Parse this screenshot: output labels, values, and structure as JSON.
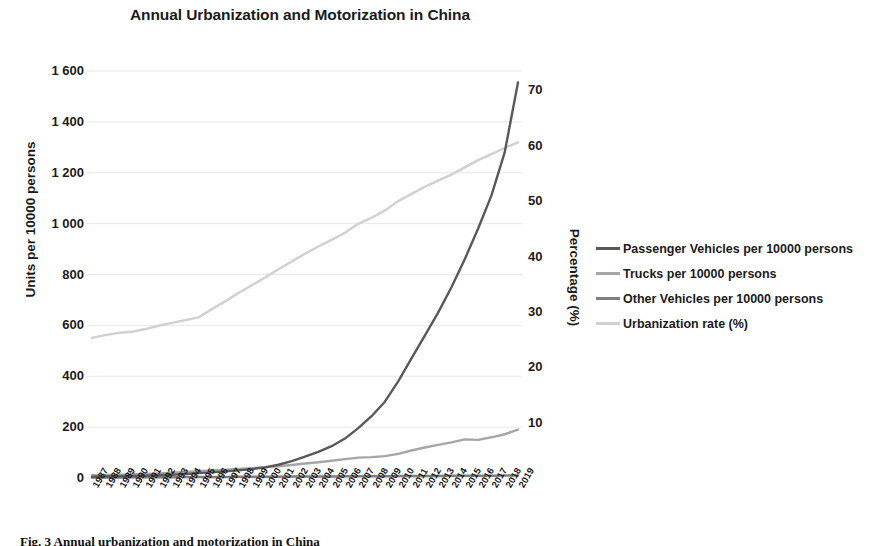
{
  "title": "Annual Urbanization and Motorization in China",
  "caption": "Fig. 3   Annual urbanization and motorization in China",
  "axes": {
    "left": {
      "label": "Units per 10000 persons",
      "ticks": [
        "0",
        "200",
        "400",
        "600",
        "800",
        "1 000",
        "1 200",
        "1 400",
        "1 600"
      ],
      "min": 0,
      "max": 1600
    },
    "right": {
      "label": "Percentage (%)",
      "ticks": [
        "10",
        "20",
        "30",
        "40",
        "50",
        "60",
        "70"
      ],
      "min": 0,
      "max": 73.5
    }
  },
  "legend": [
    {
      "label": "Passenger Vehicles per 10000 persons",
      "color": "#595959"
    },
    {
      "label": "Trucks per 10000 persons",
      "color": "#a6a6a6"
    },
    {
      "label": "Other Vehicles per 10000 persons",
      "color": "#7f7f7f"
    },
    {
      "label": "Urbanization rate (%)",
      "color": "#d0d0d0"
    }
  ],
  "chart_data": {
    "type": "line",
    "title": "Annual Urbanization and Motorization in China",
    "xlabel": "",
    "ylabel": "Units per 10000 persons",
    "y2label": "Percentage (%)",
    "ylim": [
      0,
      1600
    ],
    "y2lim": [
      0,
      73.5
    ],
    "grid": true,
    "legend_position": "right",
    "categories": [
      "1987",
      "1988",
      "1989",
      "1990",
      "1991",
      "1992",
      "1993",
      "1994",
      "1995",
      "1996",
      "1997",
      "1998",
      "1999",
      "2000",
      "2001",
      "2002",
      "2003",
      "2004",
      "2005",
      "2006",
      "2007",
      "2008",
      "2009",
      "2010",
      "2011",
      "2012",
      "2013",
      "2014",
      "2015",
      "2016",
      "2017",
      "2018",
      "2019"
    ],
    "series": [
      {
        "name": "Passenger Vehicles per 10000 persons",
        "axis": "left",
        "color": "#595959",
        "values": [
          5,
          6,
          7,
          8,
          9,
          11,
          13,
          16,
          19,
          22,
          26,
          30,
          35,
          42,
          52,
          66,
          84,
          103,
          125,
          155,
          196,
          243,
          300,
          380,
          470,
          560,
          650,
          750,
          860,
          980,
          1110,
          1280,
          1555
        ]
      },
      {
        "name": "Trucks per 10000 persons",
        "axis": "left",
        "color": "#a6a6a6",
        "values": [
          11,
          12,
          13,
          15,
          16,
          18,
          21,
          24,
          27,
          30,
          33,
          36,
          39,
          42,
          46,
          51,
          57,
          62,
          68,
          74,
          80,
          82,
          86,
          95,
          108,
          120,
          130,
          140,
          152,
          150,
          160,
          172,
          190
        ]
      },
      {
        "name": "Other Vehicles per 10000 persons",
        "axis": "left",
        "color": "#7f7f7f",
        "values": [
          2,
          2,
          2,
          3,
          3,
          3,
          3,
          4,
          4,
          4,
          4,
          5,
          5,
          5,
          5,
          6,
          6,
          6,
          6,
          7,
          7,
          7,
          7,
          8,
          8,
          8,
          8,
          9,
          9,
          9,
          9,
          10,
          10
        ]
      },
      {
        "name": "Urbanization rate (%)",
        "axis": "right",
        "color": "#d0d0d0",
        "values": [
          25.3,
          25.8,
          26.2,
          26.4,
          26.9,
          27.5,
          28.0,
          28.5,
          29.0,
          30.5,
          31.9,
          33.4,
          34.8,
          36.2,
          37.7,
          39.1,
          40.5,
          41.8,
          43.0,
          44.3,
          45.9,
          47.0,
          48.3,
          50.0,
          51.3,
          52.6,
          53.7,
          54.8,
          56.1,
          57.4,
          58.5,
          59.6,
          60.6
        ]
      }
    ]
  },
  "plot_geometry": {
    "x0": 92,
    "x1": 518,
    "y0": 71,
    "y1": 478
  }
}
